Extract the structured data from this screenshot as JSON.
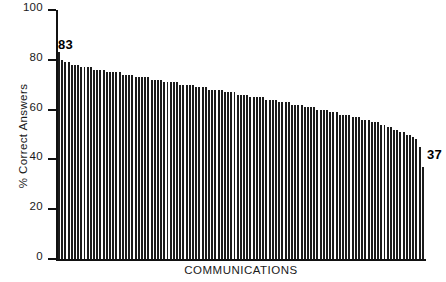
{
  "chart_data": {
    "type": "bar",
    "title": "",
    "subtitle": "",
    "xlabel": "COMMUNICATIONS",
    "ylabel": "% Correct Answers",
    "ylim": [
      0,
      100
    ],
    "yticks": [
      0,
      20,
      40,
      60,
      80,
      100
    ],
    "ytick_labels": [
      "0",
      "20",
      "40",
      "60",
      "80",
      "100"
    ],
    "xticks": [],
    "xtick_labels": [],
    "grid": false,
    "legend": null,
    "bar_color": "#1c1c1c",
    "annotations": [
      {
        "name": "first-bar-value",
        "text": "83",
        "target_index": 0
      },
      {
        "name": "last-bar-value",
        "text": "37",
        "target_index": 114
      }
    ],
    "categories_note": "individual communications, unlabeled, sorted descending",
    "values": [
      83,
      80,
      79,
      79,
      78,
      78,
      78,
      77,
      77,
      77,
      77,
      76,
      76,
      76,
      76,
      75,
      75,
      75,
      75,
      75,
      74,
      74,
      74,
      74,
      73,
      73,
      73,
      73,
      73,
      72,
      72,
      72,
      72,
      71,
      71,
      71,
      71,
      71,
      70,
      70,
      70,
      70,
      70,
      69,
      69,
      69,
      69,
      68,
      68,
      68,
      68,
      68,
      67,
      67,
      67,
      67,
      66,
      66,
      66,
      66,
      65,
      65,
      65,
      65,
      65,
      64,
      64,
      64,
      64,
      63,
      63,
      63,
      63,
      62,
      62,
      62,
      62,
      61,
      61,
      61,
      61,
      60,
      60,
      60,
      60,
      59,
      59,
      59,
      58,
      58,
      58,
      58,
      57,
      57,
      57,
      56,
      56,
      56,
      55,
      55,
      55,
      54,
      54,
      53,
      53,
      52,
      52,
      51,
      51,
      50,
      50,
      49,
      48,
      45,
      37
    ]
  },
  "colors": {
    "axis": "#111111",
    "text": "#1a1a1a",
    "bar": "#1c1c1c",
    "background": "#ffffff"
  }
}
